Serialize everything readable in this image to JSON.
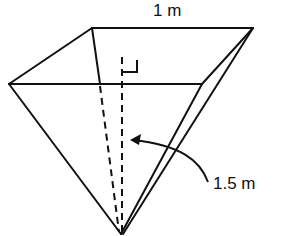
{
  "diagram": {
    "type": "inverted square pyramid",
    "labels": {
      "top_edge": "1 m",
      "height": "1.5 m"
    },
    "colors": {
      "stroke": "#111111",
      "background": "#ffffff"
    }
  }
}
